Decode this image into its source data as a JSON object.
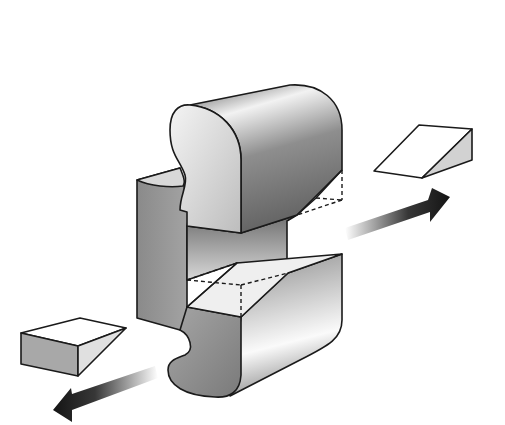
{
  "diagram": {
    "colors": {
      "background": "#ffffff",
      "outline": "#1a1a1a",
      "dark_face": "#7a7a7a",
      "mid_face": "#a8a8a8",
      "light_face": "#e6e6e6",
      "wedge_side": "#d2d2d2",
      "arrow": "#141414"
    },
    "parts": [
      {
        "id": "main-body",
        "label": "C-shaped block"
      },
      {
        "id": "upper-wedge-cut",
        "label": "dashed wedge outline in upper block"
      },
      {
        "id": "lower-wedge-cut",
        "label": "dashed wedge outline in lower block"
      },
      {
        "id": "right-wedge",
        "label": "removed wedge piece (right)"
      },
      {
        "id": "left-wedge",
        "label": "removed wedge piece (left)"
      },
      {
        "id": "right-arrow",
        "label": "arrow pointing up-right"
      },
      {
        "id": "left-arrow",
        "label": "arrow pointing down-left"
      }
    ]
  }
}
